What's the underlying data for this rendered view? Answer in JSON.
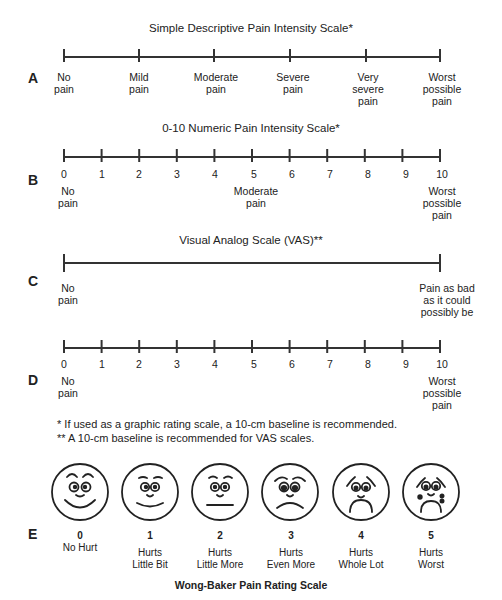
{
  "scales": {
    "A": {
      "letter": "A",
      "title": "Simple Descriptive Pain Intensity Scale*",
      "labels": [
        "No\npain",
        "Mild\npain",
        "Moderate\npain",
        "Severe\npain",
        "Very\nsevere\npain",
        "Worst\npossible\npain"
      ]
    },
    "B": {
      "letter": "B",
      "title": "0-10 Numeric Pain Intensity Scale*",
      "numbers": [
        "0",
        "1",
        "2",
        "3",
        "4",
        "5",
        "6",
        "7",
        "8",
        "9",
        "10"
      ],
      "anchor_left": "No\npain",
      "anchor_mid": "Moderate\npain",
      "anchor_right": "Worst\npossible\npain"
    },
    "C": {
      "letter": "C",
      "title": "Visual Analog Scale (VAS)**",
      "anchor_left": "No\npain",
      "anchor_right": "Pain as bad\nas it could\npossibly be"
    },
    "D": {
      "letter": "D",
      "numbers": [
        "0",
        "1",
        "2",
        "3",
        "4",
        "5",
        "6",
        "7",
        "8",
        "9",
        "10"
      ],
      "anchor_left": "No\npain",
      "anchor_right": "Worst\npossible\npain"
    },
    "E": {
      "letter": "E",
      "title": "Wong-Baker Pain Rating Scale",
      "faces": [
        {
          "num": "0",
          "label": "No Hurt",
          "icon": "face-no-hurt-icon"
        },
        {
          "num": "1",
          "label": "Hurts\nLittle Bit",
          "icon": "face-hurts-little-bit-icon"
        },
        {
          "num": "2",
          "label": "Hurts\nLittle More",
          "icon": "face-hurts-little-more-icon"
        },
        {
          "num": "3",
          "label": "Hurts\nEven More",
          "icon": "face-hurts-even-more-icon"
        },
        {
          "num": "4",
          "label": "Hurts\nWhole Lot",
          "icon": "face-hurts-whole-lot-icon"
        },
        {
          "num": "5",
          "label": "Hurts\nWorst",
          "icon": "face-hurts-worst-icon"
        }
      ]
    }
  },
  "notes": {
    "note1": "* If used as a graphic rating scale, a 10-cm baseline is recommended.",
    "note2": "** A 10-cm baseline is recommended for VAS scales."
  }
}
